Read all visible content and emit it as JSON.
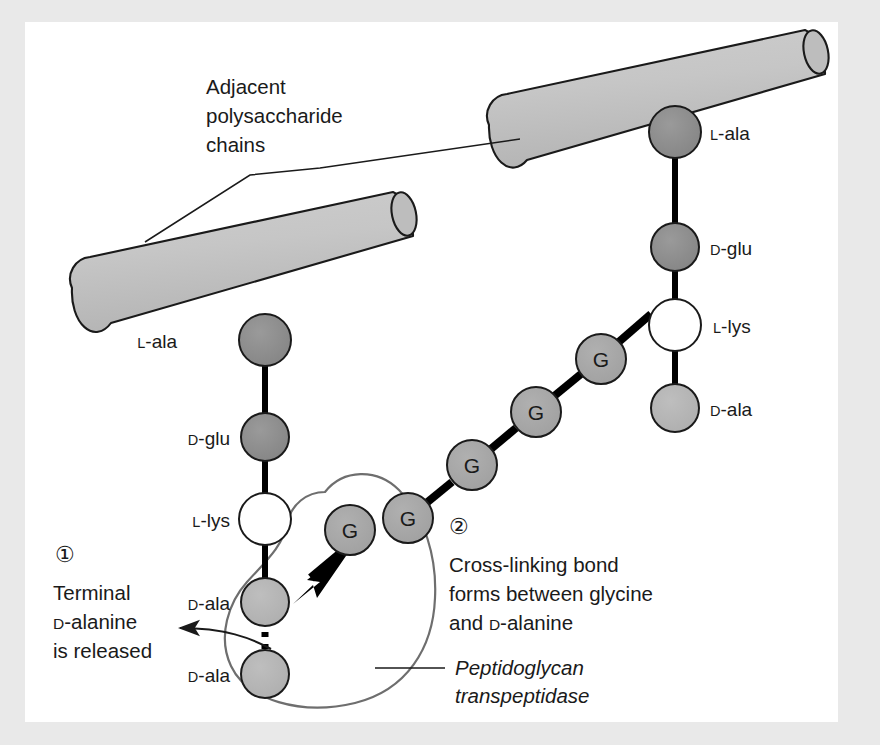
{
  "figure": {
    "background_color": "#e9e9e9",
    "canvas_color": "#ffffff"
  },
  "colors": {
    "cylinder_fill": "#c2c2c2",
    "cylinder_cap_fill": "#b6b6b6",
    "outline": "#1a1a1a",
    "residue_dark": "#8a8a8a",
    "residue_mid": "#9a9a9a",
    "residue_light": "#b4b4b4",
    "residue_white": "#ffffff",
    "glycine_fill": "#a8a8a8",
    "enzyme_outline": "#6e6e6e",
    "bond": "#000000",
    "text": "#1a1a1a"
  },
  "callouts": {
    "chains": {
      "line1": "Adjacent",
      "line2": "polysaccharide",
      "line3": "chains"
    },
    "step1": {
      "number": "①",
      "line1": "Terminal",
      "line2_sc": "D",
      "line2_rest": "-alanine",
      "line3": "is released"
    },
    "step2": {
      "number": "②",
      "line1": "Cross-linking bond",
      "line2": "forms between glycine",
      "line3_pre": "and ",
      "line3_sc": "D",
      "line3_rest": "-alanine"
    },
    "enzyme": {
      "line1": "Peptidoglycan",
      "line2": "transpeptidase"
    }
  },
  "left_chain": {
    "name": "left-peptide-chain",
    "residues": [
      {
        "id": "l-ala-left",
        "sc": "L",
        "rest": "-ala",
        "fill": "residue_dark",
        "label_side": "left"
      },
      {
        "id": "d-glu-left",
        "sc": "D",
        "rest": "-glu",
        "fill": "residue_dark",
        "label_side": "left"
      },
      {
        "id": "l-lys-left",
        "sc": "L",
        "rest": "-lys",
        "fill": "residue_white",
        "label_side": "left"
      },
      {
        "id": "d-ala-left-1",
        "sc": "D",
        "rest": "-ala",
        "fill": "residue_light",
        "label_side": "left"
      },
      {
        "id": "d-ala-left-2",
        "sc": "D",
        "rest": "-ala",
        "fill": "residue_light",
        "label_side": "left"
      }
    ]
  },
  "right_chain": {
    "name": "right-peptide-chain",
    "residues": [
      {
        "id": "l-ala-right",
        "sc": "L",
        "rest": "-ala",
        "fill": "residue_dark",
        "label_side": "right"
      },
      {
        "id": "d-glu-right",
        "sc": "D",
        "rest": "-glu",
        "fill": "residue_dark",
        "label_side": "right"
      },
      {
        "id": "l-lys-right",
        "sc": "L",
        "rest": "-lys",
        "fill": "residue_white",
        "label_side": "right"
      },
      {
        "id": "d-ala-right",
        "sc": "D",
        "rest": "-ala",
        "fill": "residue_light",
        "label_side": "right"
      }
    ]
  },
  "glycine_bridge": {
    "name": "glycine-bridge",
    "letter": "G",
    "count": 5,
    "residue_label": "glycine"
  },
  "bonds": {
    "broken_bond_style": "dotted",
    "crosslink_arrow": "thick-arrow",
    "release_arrow": "thin-arrow"
  }
}
